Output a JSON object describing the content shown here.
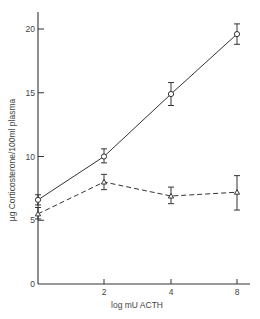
{
  "chart_data": {
    "type": "line",
    "title": "",
    "xlabel": "log mU ACTH",
    "ylabel": "µg Corticosterone/100ml plasma",
    "x_ticks": [
      0,
      2,
      4,
      8
    ],
    "x_tick_labels": [
      "",
      "2",
      "4",
      "8"
    ],
    "y_ticks": [
      0,
      5,
      10,
      15,
      20
    ],
    "y_tick_labels": [
      "0",
      "5",
      "10",
      "15",
      "20"
    ],
    "ylim": [
      0,
      21
    ],
    "grid": false,
    "legend": null,
    "series": [
      {
        "name": "circles (solid line)",
        "marker": "circle",
        "line": "solid",
        "x": [
          0,
          2,
          4,
          8
        ],
        "values": [
          6.6,
          10.0,
          14.9,
          19.6
        ],
        "err_low": [
          6.2,
          9.5,
          14.0,
          18.8
        ],
        "err_high": [
          7.0,
          10.6,
          15.8,
          20.4
        ]
      },
      {
        "name": "triangles (dashed line)",
        "marker": "triangle",
        "line": "dashed",
        "x": [
          0,
          2,
          4,
          8
        ],
        "values": [
          5.5,
          8.0,
          6.9,
          7.2
        ],
        "err_low": [
          5.1,
          7.4,
          6.3,
          5.8
        ],
        "err_high": [
          6.0,
          8.6,
          7.6,
          8.5
        ]
      }
    ]
  }
}
